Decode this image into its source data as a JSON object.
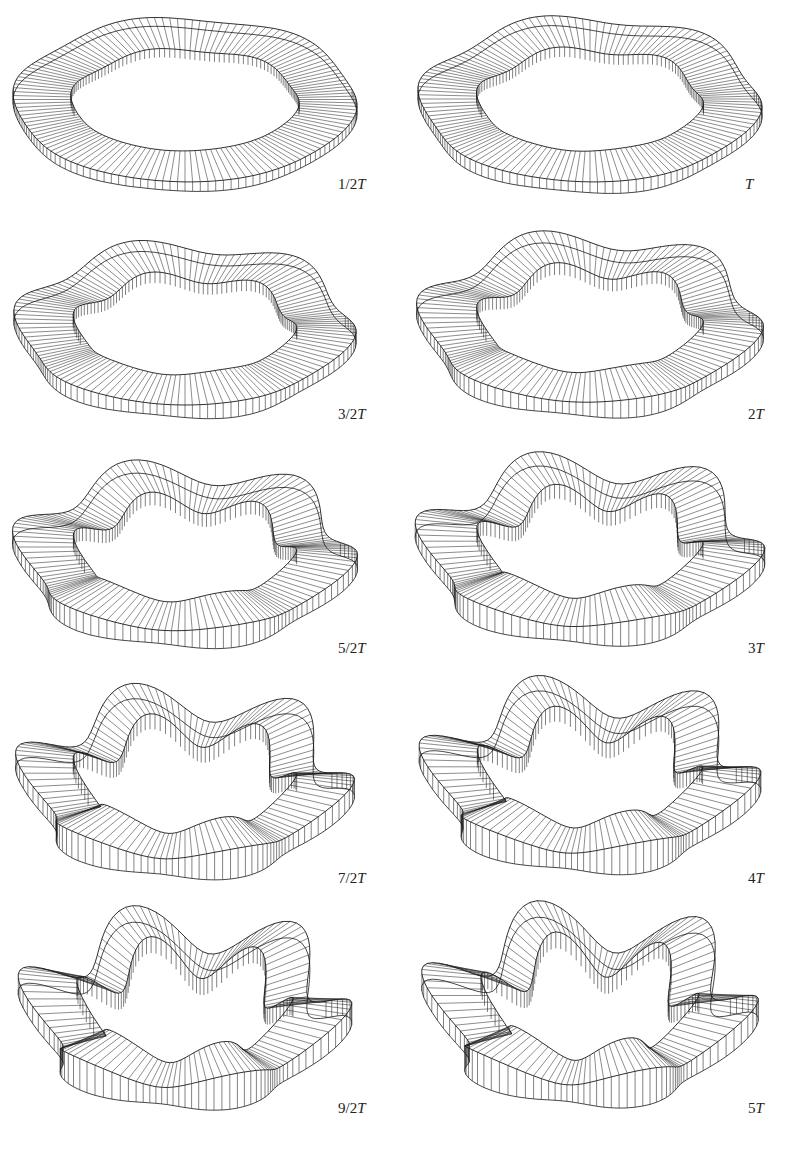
{
  "figure": {
    "caption": "",
    "stroke_color": "#1a1a1a",
    "background": "#ffffff",
    "panels": [
      {
        "id": "p1",
        "label_num": "1/2",
        "label_T": "T",
        "cx": 185,
        "cy": 100,
        "rx": 170,
        "ry": 82,
        "width": 26,
        "height": 16,
        "waves": 6,
        "amp": 0.02,
        "label_x": 338,
        "label_y": 176
      },
      {
        "id": "p2",
        "label_num": "",
        "label_T": "T",
        "cx": 590,
        "cy": 100,
        "rx": 168,
        "ry": 82,
        "width": 26,
        "height": 18,
        "waves": 6,
        "amp": 0.035,
        "label_x": 745,
        "label_y": 176
      },
      {
        "id": "p3",
        "label_num": "3/2",
        "label_T": "T",
        "cx": 185,
        "cy": 325,
        "rx": 165,
        "ry": 80,
        "width": 26,
        "height": 20,
        "waves": 6,
        "amp": 0.05,
        "label_x": 338,
        "label_y": 406
      },
      {
        "id": "p4",
        "label_num": "2",
        "label_T": "T",
        "cx": 590,
        "cy": 320,
        "rx": 165,
        "ry": 82,
        "width": 26,
        "height": 22,
        "waves": 6,
        "amp": 0.065,
        "label_x": 748,
        "label_y": 406
      },
      {
        "id": "p5",
        "label_num": "5/2",
        "label_T": "T",
        "cx": 185,
        "cy": 550,
        "rx": 162,
        "ry": 80,
        "width": 26,
        "height": 24,
        "waves": 6,
        "amp": 0.08,
        "label_x": 338,
        "label_y": 640
      },
      {
        "id": "p6",
        "label_num": "3",
        "label_T": "T",
        "cx": 590,
        "cy": 545,
        "rx": 162,
        "ry": 80,
        "width": 26,
        "height": 26,
        "waves": 6,
        "amp": 0.095,
        "label_x": 748,
        "label_y": 640
      },
      {
        "id": "p7",
        "label_num": "7/2",
        "label_T": "T",
        "cx": 185,
        "cy": 778,
        "rx": 155,
        "ry": 78,
        "width": 24,
        "height": 28,
        "waves": 6,
        "amp": 0.11,
        "label_x": 338,
        "label_y": 870
      },
      {
        "id": "p8",
        "label_num": "4",
        "label_T": "T",
        "cx": 590,
        "cy": 772,
        "rx": 155,
        "ry": 78,
        "width": 24,
        "height": 28,
        "waves": 6,
        "amp": 0.12,
        "label_x": 748,
        "label_y": 870
      },
      {
        "id": "p9",
        "label_num": "9/2",
        "label_T": "T",
        "cx": 185,
        "cy": 1005,
        "rx": 150,
        "ry": 78,
        "width": 24,
        "height": 30,
        "waves": 6,
        "amp": 0.13,
        "label_x": 338,
        "label_y": 1100
      },
      {
        "id": "p10",
        "label_num": "5",
        "label_T": "T",
        "cx": 590,
        "cy": 1002,
        "rx": 150,
        "ry": 78,
        "width": 24,
        "height": 30,
        "waves": 6,
        "amp": 0.14,
        "label_x": 748,
        "label_y": 1100
      }
    ]
  }
}
